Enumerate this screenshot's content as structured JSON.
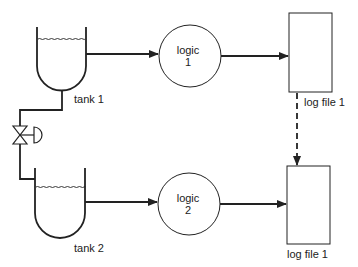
{
  "diagram": {
    "tanks": [
      {
        "id": "tank1",
        "label": "tank 1"
      },
      {
        "id": "tank2",
        "label": "tank 2"
      }
    ],
    "logic": [
      {
        "id": "logic1",
        "line1": "logic",
        "line2": "1"
      },
      {
        "id": "logic2",
        "line1": "logic",
        "line2": "2"
      }
    ],
    "log_files": [
      {
        "id": "logfile_top",
        "label": "log file 1"
      },
      {
        "id": "logfile_bottom",
        "label": "log file 1"
      }
    ],
    "valve": {
      "id": "valve",
      "label": ""
    },
    "colors": {
      "stroke": "#222222",
      "background": "#ffffff"
    }
  }
}
